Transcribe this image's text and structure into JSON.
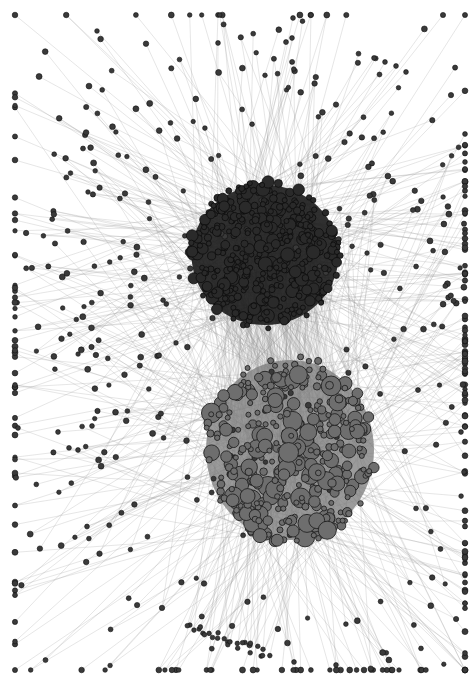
{
  "figure": {
    "type": "network-graph",
    "width": 474,
    "height": 684,
    "background": "#ffffff",
    "edge_color": "#9a9a9a",
    "clusters": [
      {
        "name": "upper-cluster",
        "center": [
          265,
          255
        ],
        "radius": [
          70,
          70
        ],
        "core_node_count": 420,
        "node_fill": "#2a2a2a",
        "node_stroke": "#0d0d0d",
        "node_size_range": [
          2.5,
          7
        ],
        "halo_color": "#1a1a1a"
      },
      {
        "name": "lower-cluster",
        "center": [
          290,
          450
        ],
        "radius": [
          80,
          90
        ],
        "core_node_count": 380,
        "node_fill": "#6e6e6e",
        "node_stroke": "#222222",
        "node_size_range": [
          2.5,
          10
        ],
        "halo_color": "#7a7a7a"
      }
    ],
    "periphery": {
      "leaf_node_count": 520,
      "leaf_size": 2.2,
      "spread_x": [
        15,
        465
      ],
      "spread_y": [
        15,
        670
      ]
    },
    "notable_leaves": [
      {
        "x": 18,
        "y": 428
      },
      {
        "x": 58,
        "y": 432
      },
      {
        "x": 92,
        "y": 426
      },
      {
        "x": 78,
        "y": 450
      },
      {
        "x": 293,
        "y": 18
      },
      {
        "x": 292,
        "y": 38
      },
      {
        "x": 218,
        "y": 43
      },
      {
        "x": 374,
        "y": 58
      },
      {
        "x": 385,
        "y": 62
      },
      {
        "x": 396,
        "y": 66
      },
      {
        "x": 406,
        "y": 72
      },
      {
        "x": 461,
        "y": 432
      },
      {
        "x": 464,
        "y": 472
      },
      {
        "x": 294,
        "y": 662
      },
      {
        "x": 336,
        "y": 665
      }
    ],
    "bottom_fan": {
      "anchor": [
        260,
        500
      ],
      "count": 26,
      "from": [
        187,
        625
      ],
      "to": [
        268,
        655
      ]
    }
  }
}
